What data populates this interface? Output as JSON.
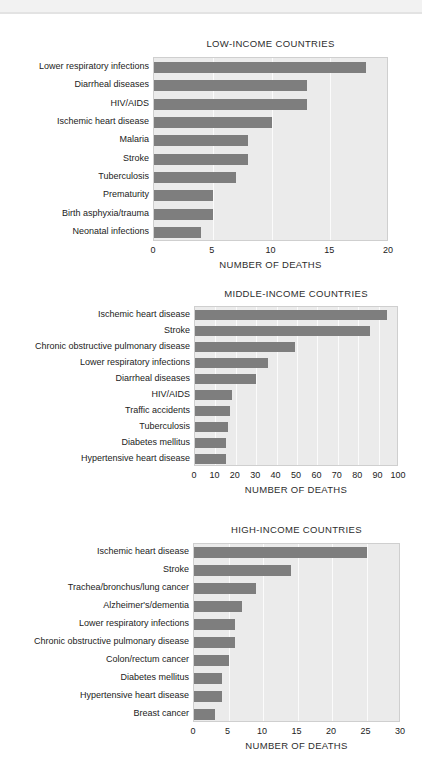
{
  "page": {
    "background_color": "#ffffff",
    "bar_color": "#7e7e7e",
    "plot_background_color": "#ebebeb",
    "gridline_color": "#fbfbfb",
    "axis_label": "NUMBER OF DEATHS"
  },
  "chart_data": [
    {
      "type": "bar",
      "orientation": "horizontal",
      "title": "LOW-INCOME COUNTRIES",
      "xlabel": "NUMBER OF DEATHS",
      "ylabel": "",
      "xlim": [
        0,
        20
      ],
      "xticks": [
        0,
        5,
        10,
        15,
        20
      ],
      "xtick_labels": [
        "0",
        "5",
        "10",
        "15",
        "20"
      ],
      "grid": true,
      "legend": "none",
      "categories": [
        "Lower respiratory infections",
        "Diarrheal diseases",
        "HIV/AIDS",
        "Ischemic heart disease",
        "Malaria",
        "Stroke",
        "Tuberculosis",
        "Prematurity",
        "Birth asphyxia/trauma",
        "Neonatal infections"
      ],
      "values": [
        18,
        13,
        13,
        10,
        8,
        8,
        7,
        5,
        5,
        4
      ]
    },
    {
      "type": "bar",
      "orientation": "horizontal",
      "title": "MIDDLE-INCOME COUNTRIES",
      "xlabel": "NUMBER OF DEATHS",
      "ylabel": "",
      "xlim": [
        0,
        100
      ],
      "xticks": [
        0,
        10,
        20,
        30,
        40,
        50,
        60,
        70,
        80,
        90,
        100
      ],
      "xtick_labels": [
        "0",
        "10",
        "20",
        "30",
        "40",
        "50",
        "60",
        "70",
        "80",
        "90",
        "100"
      ],
      "grid": true,
      "legend": "none",
      "categories": [
        "Ischemic heart disease",
        "Stroke",
        "Chronic obstructive pulmonary disease",
        "Lower respiratory infections",
        "Diarrheal diseases",
        "HIV/AIDS",
        "Traffic accidents",
        "Tuberculosis",
        "Diabetes mellitus",
        "Hypertensive heart disease"
      ],
      "values": [
        94,
        86,
        49,
        36,
        30,
        18,
        17,
        16,
        15,
        15
      ]
    },
    {
      "type": "bar",
      "orientation": "horizontal",
      "title": "HIGH-INCOME COUNTRIES",
      "xlabel": "NUMBER OF DEATHS",
      "ylabel": "",
      "xlim": [
        0,
        30
      ],
      "xticks": [
        0,
        5,
        10,
        15,
        20,
        25,
        30
      ],
      "xtick_labels": [
        "0",
        "5",
        "10",
        "15",
        "20",
        "25",
        "30"
      ],
      "grid": true,
      "legend": "none",
      "categories": [
        "Ischemic heart disease",
        "Stroke",
        "Trachea/bronchus/lung cancer",
        "Alzheimer's/dementia",
        "Lower respiratory infections",
        "Chronic obstructive pulmonary disease",
        "Colon/rectum cancer",
        "Diabetes mellitus",
        "Hypertensive heart disease",
        "Breast cancer"
      ],
      "values": [
        25,
        14,
        9,
        7,
        6,
        6,
        5,
        4,
        4,
        3
      ]
    }
  ]
}
